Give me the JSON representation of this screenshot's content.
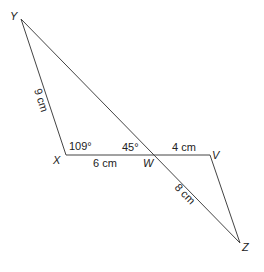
{
  "diagram": {
    "points": {
      "Y": {
        "label": "Y",
        "x": 21,
        "y": 19
      },
      "X": {
        "label": "X",
        "x": 66,
        "y": 155
      },
      "W": {
        "label": "W",
        "x": 152,
        "y": 155
      },
      "V": {
        "label": "V",
        "x": 210,
        "y": 155
      },
      "Z": {
        "label": "Z",
        "x": 240,
        "y": 243
      }
    },
    "segments": [
      {
        "from": "Y",
        "to": "X",
        "label": "9 cm"
      },
      {
        "from": "X",
        "to": "W",
        "label": "6 cm"
      },
      {
        "from": "W",
        "to": "V",
        "label": "4 cm"
      },
      {
        "from": "W",
        "to": "Z",
        "label": "8 cm"
      },
      {
        "from": "Y",
        "to": "W",
        "label": ""
      },
      {
        "from": "V",
        "to": "Z",
        "label": ""
      }
    ],
    "angles": {
      "YXW": "109°",
      "YWX": "45°"
    },
    "colors": {
      "line": "#444444",
      "text": "#222222"
    }
  }
}
